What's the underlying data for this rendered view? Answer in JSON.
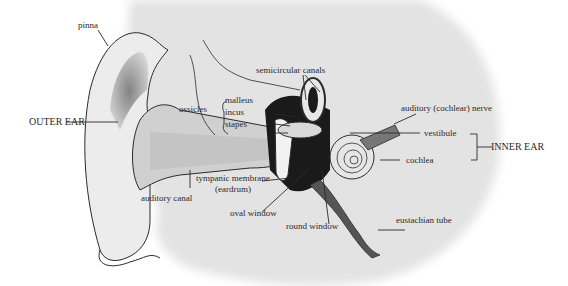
{
  "diagram": {
    "type": "anatomical-diagram",
    "colors": {
      "background": "#ffffff",
      "head_silhouette": "#e3e3e3",
      "ear_fill": "#ececec",
      "line": "#2a2a2a",
      "dark_shading": "#1a1a1a"
    },
    "section_labels": {
      "outer_ear": "OUTER EAR",
      "inner_ear": "INNER EAR"
    },
    "labels": {
      "pinna": "pinna",
      "ossicles": "ossicles",
      "malleus": "malleus",
      "incus": "incus",
      "stapes": "stapes",
      "semicircular_canals": "semicircular canals",
      "auditory_nerve": "auditory (cochlear) nerve",
      "vestibule": "vestibule",
      "cochlea": "cochlea",
      "tympanic_membrane_1": "tympanic membrane",
      "tympanic_membrane_2": "(eardrum)",
      "auditory_canal": "auditory canal",
      "oval_window": "oval window",
      "round_window": "round window",
      "eustachian_tube": "eustachian tube"
    }
  }
}
